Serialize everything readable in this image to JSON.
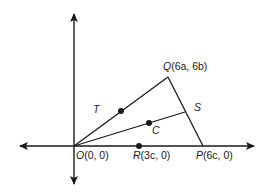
{
  "diagram": {
    "type": "coordinate-geometry-triangle",
    "colors": {
      "line": "#1a1a1a",
      "background": "#ffffff"
    },
    "axes": {
      "x_arrows": "both",
      "y_arrows": "both"
    },
    "points": {
      "O": {
        "name": "O",
        "coords": "(0, 0)"
      },
      "R": {
        "name": "R",
        "coords": "(3c, 0)"
      },
      "P": {
        "name": "P",
        "coords": "(6c, 0)"
      },
      "Q": {
        "name": "Q",
        "coords": "(6a, 6b)"
      },
      "S": {
        "name": "S"
      },
      "T": {
        "name": "T"
      },
      "C": {
        "name": "C"
      }
    },
    "segments": [
      "OQ",
      "QP",
      "OP",
      "OS"
    ],
    "marked_dots": [
      "midpoint of OQ",
      "C",
      "R"
    ]
  }
}
